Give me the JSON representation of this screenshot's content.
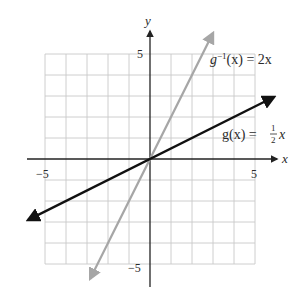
{
  "chart_data": {
    "type": "line",
    "title": "",
    "xlabel": "x",
    "ylabel": "y",
    "xlim": [
      -6,
      6
    ],
    "ylim": [
      -6,
      6
    ],
    "grid": true,
    "grid_range": [
      -5,
      5
    ],
    "x_ticks": [
      "-5",
      "5"
    ],
    "y_ticks": [
      "5",
      "-5"
    ],
    "series": [
      {
        "name": "g(x) = 1/2 x",
        "label_main": "g(x) = ",
        "label_frac_num": "1",
        "label_frac_den": "2",
        "label_tail": "x",
        "slope": 0.5,
        "color": "#111111",
        "x": [
          -5.8,
          5.9
        ],
        "y": [
          -2.9,
          2.95
        ]
      },
      {
        "name": "g^-1(x) = 2x",
        "label_pre": "g",
        "label_sup": "−1",
        "label_post": "(x) = 2x",
        "slope": 2,
        "color": "#a6a6a6",
        "x": [
          -2.85,
          3.0
        ],
        "y": [
          -5.7,
          6.0
        ]
      }
    ],
    "legend_position": "inline-annotations"
  },
  "labels": {
    "x_axis": "x",
    "y_axis": "y",
    "x_tick_neg": "−5",
    "x_tick_pos": "5",
    "y_tick_pos": "5",
    "y_tick_neg": "−5"
  }
}
